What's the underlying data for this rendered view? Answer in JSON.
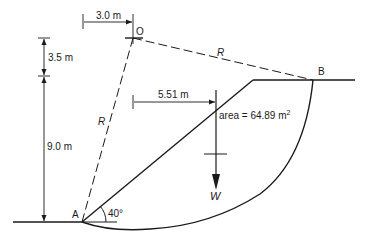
{
  "diagram": {
    "type": "slope stability circular slip surface",
    "points": {
      "O": {
        "label": "O"
      },
      "A": {
        "label": "A"
      },
      "B": {
        "label": "B"
      }
    },
    "dimensions": {
      "horizontal_offset": "3.0 m",
      "top_height": "3.5 m",
      "slope_height": "9.0 m",
      "weight_lever_arm": "5.51 m"
    },
    "radius_labels": [
      "R",
      "R"
    ],
    "area_label": "area = 64.89 m",
    "area_superscript": "2",
    "slope_angle": "40°",
    "weight_label": "W",
    "colors": {
      "line": "#1a1a1a",
      "background": "#ffffff"
    }
  }
}
